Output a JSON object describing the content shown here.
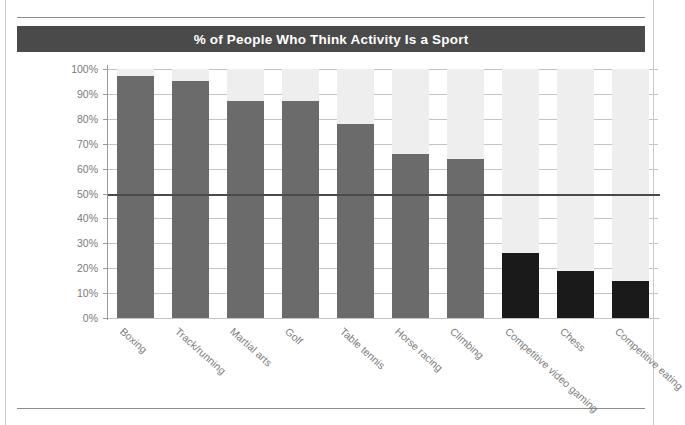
{
  "title": "% of People Who Think Activity Is a Sport",
  "colors": {
    "title_band": "#4a4a4a",
    "title_text": "#ffffff",
    "bar_gray": "#6b6b6b",
    "bar_black": "#1a1a1a",
    "column_band": "#eeeeee",
    "gridline": "#c4c4c4",
    "reference_line": "#4a4a4a",
    "axis": "#9a9a9a",
    "tick_label": "#7a7a7a"
  },
  "chart_data": {
    "type": "bar",
    "title": "% of People Who Think Activity Is a Sport",
    "xlabel": "",
    "ylabel": "",
    "ylim": [
      0,
      100
    ],
    "yticks": [
      "0%",
      "10%",
      "20%",
      "30%",
      "40%",
      "50%",
      "60%",
      "70%",
      "80%",
      "90%",
      "100%"
    ],
    "grid": true,
    "legend": "none",
    "reference_line": 50,
    "categories": [
      "Boxing",
      "Track/running",
      "Martial arts",
      "Golf",
      "Table tennis",
      "Horse racing",
      "Climbing",
      "Competitive video gaming",
      "Chess",
      "Competitive eating"
    ],
    "values": [
      97,
      95,
      87,
      87,
      78,
      66,
      64,
      26,
      19,
      15
    ],
    "bar_styles": [
      "gray",
      "gray",
      "gray",
      "gray",
      "gray",
      "gray",
      "gray",
      "black",
      "black",
      "black"
    ]
  }
}
